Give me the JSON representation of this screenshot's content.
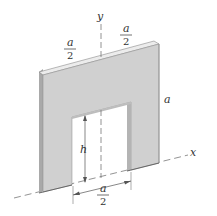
{
  "figure": {
    "colors": {
      "face": "#d0d0d0",
      "top_edge": "#ececec",
      "side_edge": "#a9a9a9",
      "inner_edge": "#b4b4b4",
      "line": "#555555",
      "dashed": "#777777"
    },
    "axes": {
      "y_label": "y",
      "x_label": "x"
    },
    "dimensions": {
      "top_left_half": {
        "numerator": "a",
        "denominator": "2"
      },
      "top_right_half": {
        "numerator": "a",
        "denominator": "2"
      },
      "side": "a",
      "opening_height": "h",
      "opening_width": {
        "numerator": "a",
        "denominator": "2"
      }
    }
  }
}
